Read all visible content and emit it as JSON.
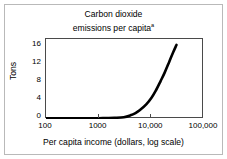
{
  "chart_data": {
    "type": "line",
    "title_line1": "Carbon dioxide",
    "title_line2": "emissions per capita",
    "title_footnote_marker": "a",
    "xlabel": "Per capita income (dollars, log scale)",
    "ylabel": "Tons",
    "xscale": "log",
    "yscale": "linear",
    "xlim": [
      100,
      100000
    ],
    "ylim": [
      0,
      17.5
    ],
    "grid": false,
    "legend": null,
    "xticks": [
      100,
      1000,
      10000,
      100000
    ],
    "xtick_labels": [
      "100",
      "1000",
      "10,000",
      "100,000"
    ],
    "yticks": [
      0,
      4,
      8,
      12,
      16
    ],
    "ytick_labels": [
      "0",
      "4",
      "8",
      "12",
      "16"
    ],
    "series": [
      {
        "name": "CO2 emissions per capita",
        "color": "#000000",
        "line_width": 2.6,
        "x": [
          100,
          200,
          400,
          700,
          1000,
          1500,
          2000,
          3000,
          4000,
          5000,
          6000,
          8000,
          10000,
          12000,
          15000,
          18000,
          22000,
          26000,
          30000
        ],
        "y": [
          0.15,
          0.15,
          0.16,
          0.17,
          0.18,
          0.2,
          0.25,
          0.4,
          0.8,
          1.3,
          1.9,
          3.2,
          4.6,
          6.1,
          8.3,
          10.2,
          12.6,
          14.6,
          16.2
        ]
      }
    ]
  },
  "figure": {
    "background_color": "#ffffff",
    "frame_color": "#b9b9b9",
    "axis_color": "#4a4a4a"
  }
}
